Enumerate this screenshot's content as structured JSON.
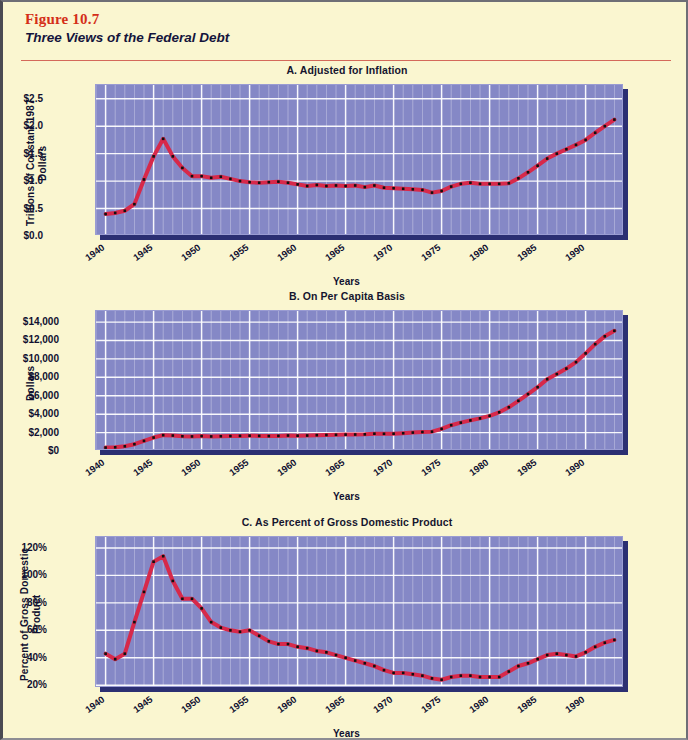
{
  "figure": {
    "number": "Figure 10.7",
    "title": "Three Views of the Federal Debt"
  },
  "colors": {
    "page_background": "#faf6d0",
    "figure_number": "#d42e18",
    "rule": "#d4695a",
    "plot_background": "#8588c6",
    "gridline": "#ffffff",
    "line": "#d7294a",
    "marker": "#101010",
    "plot_shadow": "#2b2f72",
    "text": "#101030"
  },
  "chart_data": [
    {
      "id": "A",
      "type": "line",
      "title": "A. Adjusted for Inflation",
      "xlabel": "Years",
      "ylabel": "Trillions of Constant 1987 Dollars",
      "xlim": [
        1939,
        1994
      ],
      "ylim": [
        0.0,
        2.75
      ],
      "ytick_labels": [
        "$0.0",
        "$0.5",
        "$1.0",
        "$1.5",
        "$2.0",
        "$2.5"
      ],
      "ytick_values": [
        0.0,
        0.5,
        1.0,
        1.5,
        2.0,
        2.5
      ],
      "xtick_labels": [
        "1940",
        "1945",
        "1950",
        "1955",
        "1960",
        "1965",
        "1970",
        "1975",
        "1980",
        "1985",
        "1990"
      ],
      "xtick_values": [
        1940,
        1945,
        1950,
        1955,
        1960,
        1965,
        1970,
        1975,
        1980,
        1985,
        1990
      ],
      "grid": true,
      "legend": "none",
      "x": [
        1940,
        1941,
        1942,
        1943,
        1944,
        1945,
        1946,
        1947,
        1948,
        1949,
        1950,
        1951,
        1952,
        1953,
        1954,
        1955,
        1956,
        1957,
        1958,
        1959,
        1960,
        1961,
        1962,
        1963,
        1964,
        1965,
        1966,
        1967,
        1968,
        1969,
        1970,
        1971,
        1972,
        1973,
        1974,
        1975,
        1976,
        1977,
        1978,
        1979,
        1980,
        1981,
        1982,
        1983,
        1984,
        1985,
        1986,
        1987,
        1988,
        1989,
        1990,
        1991,
        1992,
        1993
      ],
      "y": [
        0.4,
        0.42,
        0.46,
        0.58,
        1.03,
        1.45,
        1.77,
        1.45,
        1.24,
        1.09,
        1.09,
        1.06,
        1.08,
        1.04,
        1.0,
        0.98,
        0.97,
        0.98,
        0.99,
        0.97,
        0.94,
        0.91,
        0.93,
        0.91,
        0.92,
        0.91,
        0.92,
        0.89,
        0.92,
        0.88,
        0.87,
        0.86,
        0.85,
        0.84,
        0.79,
        0.82,
        0.9,
        0.95,
        0.97,
        0.95,
        0.95,
        0.95,
        0.96,
        1.05,
        1.16,
        1.28,
        1.41,
        1.5,
        1.58,
        1.66,
        1.75,
        1.88,
        2.0,
        2.12,
        2.21,
        2.3,
        2.4,
        2.52,
        2.66
      ]
    },
    {
      "id": "B",
      "type": "line",
      "title": "B. On Per Capita Basis",
      "xlabel": "Years",
      "ylabel": "Dollars",
      "xlim": [
        1939,
        1994
      ],
      "ylim": [
        0,
        15200
      ],
      "ytick_labels": [
        "$0",
        "$2,000",
        "$4,000",
        "$6,000",
        "$8,000",
        "$10,000",
        "$12,000",
        "$14,000"
      ],
      "ytick_values": [
        0,
        2000,
        4000,
        6000,
        8000,
        10000,
        12000,
        14000
      ],
      "xtick_labels": [
        "1940",
        "1945",
        "1950",
        "1955",
        "1960",
        "1965",
        "1970",
        "1975",
        "1980",
        "1985",
        "1990"
      ],
      "xtick_values": [
        1940,
        1945,
        1950,
        1955,
        1960,
        1965,
        1970,
        1975,
        1980,
        1985,
        1990
      ],
      "grid": true,
      "legend": "none",
      "x": [
        1940,
        1941,
        1942,
        1943,
        1944,
        1945,
        1946,
        1947,
        1948,
        1949,
        1950,
        1951,
        1952,
        1953,
        1954,
        1955,
        1956,
        1957,
        1958,
        1959,
        1960,
        1961,
        1962,
        1963,
        1964,
        1965,
        1966,
        1967,
        1968,
        1969,
        1970,
        1971,
        1972,
        1973,
        1974,
        1975,
        1976,
        1977,
        1978,
        1979,
        1980,
        1981,
        1982,
        1983,
        1984,
        1985,
        1986,
        1987,
        1988,
        1989,
        1990,
        1991,
        1992,
        1993
      ],
      "y": [
        370,
        400,
        510,
        740,
        1100,
        1460,
        1720,
        1680,
        1600,
        1580,
        1620,
        1580,
        1600,
        1620,
        1640,
        1660,
        1640,
        1620,
        1640,
        1680,
        1660,
        1680,
        1720,
        1740,
        1760,
        1780,
        1790,
        1810,
        1880,
        1870,
        1880,
        1930,
        2000,
        2060,
        2100,
        2400,
        2800,
        3080,
        3320,
        3540,
        3820,
        4200,
        4750,
        5450,
        6180,
        6930,
        7800,
        8350,
        8950,
        9650,
        10600,
        11600,
        12450,
        13050
      ]
    },
    {
      "id": "C",
      "type": "line",
      "title": "C. As Percent of Gross Domestic Product",
      "xlabel": "Years",
      "ylabel": "Percent of Gross Domestic Product",
      "xlim": [
        1939,
        1994
      ],
      "ylim": [
        18,
        128
      ],
      "ytick_labels": [
        "20%",
        "40%",
        "60%",
        "80%",
        "100%",
        "120%"
      ],
      "ytick_values": [
        20,
        40,
        60,
        80,
        100,
        120
      ],
      "xtick_labels": [
        "1940",
        "1945",
        "1950",
        "1955",
        "1960",
        "1965",
        "1970",
        "1975",
        "1980",
        "1985",
        "1990"
      ],
      "xtick_values": [
        1940,
        1945,
        1950,
        1955,
        1960,
        1965,
        1970,
        1975,
        1980,
        1985,
        1990
      ],
      "grid": true,
      "legend": "none",
      "x": [
        1940,
        1941,
        1942,
        1943,
        1944,
        1945,
        1946,
        1947,
        1948,
        1949,
        1950,
        1951,
        1952,
        1953,
        1954,
        1955,
        1956,
        1957,
        1958,
        1959,
        1960,
        1961,
        1962,
        1963,
        1964,
        1965,
        1966,
        1967,
        1968,
        1969,
        1970,
        1971,
        1972,
        1973,
        1974,
        1975,
        1976,
        1977,
        1978,
        1979,
        1980,
        1981,
        1982,
        1983,
        1984,
        1985,
        1986,
        1987,
        1988,
        1989,
        1990,
        1991,
        1992,
        1993
      ],
      "y": [
        43,
        39,
        43,
        66,
        88,
        110,
        114,
        96,
        83,
        83,
        76,
        66,
        62,
        60,
        59,
        60,
        56,
        52,
        50,
        50,
        48,
        47,
        45,
        44,
        42,
        40,
        38,
        36,
        34,
        31,
        29,
        29,
        28,
        27,
        25,
        24,
        26,
        27,
        27,
        26,
        26,
        26,
        30,
        34,
        36,
        39,
        42,
        43,
        42,
        41,
        44,
        48,
        51,
        53
      ]
    }
  ]
}
